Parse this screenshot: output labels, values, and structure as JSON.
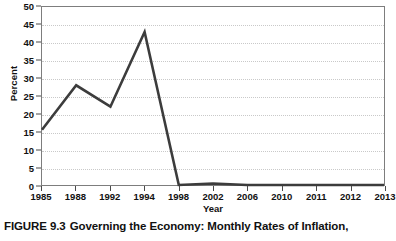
{
  "caption": {
    "figure_number": "FIGURE 9.3",
    "text": "Governing the Economy: Monthly Rates of Inflation,"
  },
  "chart_data": {
    "type": "line",
    "title": "",
    "xlabel": "Year",
    "ylabel": "Percent",
    "categories": [
      "1985",
      "1988",
      "1992",
      "1994",
      "1998",
      "2002",
      "2006",
      "2010",
      "2011",
      "2012",
      "2013"
    ],
    "values": [
      15.5,
      28,
      22,
      43,
      0,
      0.4,
      0,
      0,
      0,
      0,
      0
    ],
    "ylim": [
      0,
      50
    ],
    "yticks": [
      0,
      5,
      10,
      15,
      20,
      25,
      30,
      35,
      40,
      45,
      50
    ],
    "ytick_labels": [
      "0",
      "5",
      "10",
      "15",
      "20",
      "25",
      "30",
      "35",
      "40",
      "45",
      "50"
    ],
    "grid": true,
    "grid_style": "dotted",
    "legend": "none",
    "series": [
      {
        "name": "Monthly Rates of Inflation",
        "color": "#3c3c3c",
        "values": [
          15.5,
          28,
          22,
          43,
          0,
          0.4,
          0,
          0,
          0,
          0,
          0
        ]
      }
    ]
  },
  "colors": {
    "line": "#3c3c3c",
    "grid": "#c9c9c9",
    "axis": "#7d7d7d",
    "text": "#111111",
    "background": "#ffffff"
  }
}
